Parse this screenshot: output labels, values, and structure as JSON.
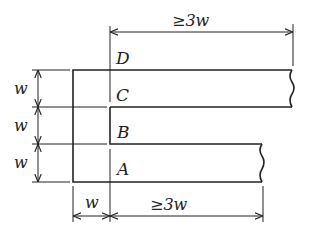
{
  "diagram": {
    "title": "",
    "points": [
      {
        "id": "D",
        "label": "D"
      },
      {
        "id": "C",
        "label": "C"
      },
      {
        "id": "B",
        "label": "B"
      },
      {
        "id": "A",
        "label": "A"
      }
    ],
    "dimensions": {
      "top_length": "≥3w",
      "bottom_length": "≥3w",
      "bottom_width": "w",
      "left_heights": [
        "w",
        "w",
        "w"
      ]
    }
  }
}
